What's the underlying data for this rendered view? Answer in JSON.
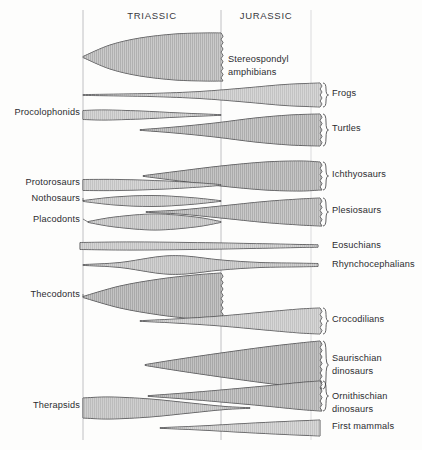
{
  "figure": {
    "background_color": "#fdfdfc",
    "width": 422,
    "height": 450
  },
  "periods": [
    {
      "name": "TRIASSIC",
      "label_x": 152,
      "label_y": 19,
      "start_x": 83,
      "end_x": 221
    },
    {
      "name": "JURASSIC",
      "label_x": 266,
      "label_y": 19,
      "start_x": 221,
      "end_x": 311
    }
  ],
  "axis": {
    "lines": [
      {
        "name": "triassic-start-line",
        "x": 83,
        "y1": 10,
        "y2": 440,
        "faint": false
      },
      {
        "name": "triassic-jurassic-boundary-line",
        "x": 221,
        "y1": 10,
        "y2": 440,
        "faint": false
      },
      {
        "name": "jurassic-end-line",
        "x": 311,
        "y1": 10,
        "y2": 440,
        "faint": true
      }
    ]
  },
  "chart_data": {
    "type": "area",
    "xlabel": "Geologic time",
    "ylabel": "Taxonomic group",
    "x_categories": [
      "TRIASSIC",
      "JURASSIC"
    ],
    "series": [
      {
        "name": "Stereospondyl amphibians",
        "label_side": "inline",
        "label_x": 228,
        "label_y": 62,
        "label_lines": [
          "Stereospondyl",
          "amphibians"
        ],
        "axis_y": 57,
        "x_start": 83,
        "x_end": 221,
        "max_half_width": 24,
        "peak_x": 180,
        "truncated_right": true,
        "shade": "#cfcfcf",
        "points": [
          {
            "x": 83,
            "half": 0.5
          },
          {
            "x": 110,
            "half": 12
          },
          {
            "x": 140,
            "half": 19
          },
          {
            "x": 175,
            "half": 23
          },
          {
            "x": 205,
            "half": 24
          },
          {
            "x": 221,
            "half": 24
          }
        ]
      },
      {
        "name": "Frogs",
        "label_side": "right",
        "label_x": 332,
        "label_y": 96,
        "label_lines": [
          "Frogs"
        ],
        "axis_y": 95,
        "x_start": 83,
        "x_end": 320,
        "max_half_width": 12,
        "peak_x": 320,
        "truncated_right": true,
        "shade": "#d4d4d4",
        "points": [
          {
            "x": 83,
            "half": 0.4
          },
          {
            "x": 150,
            "half": 1.5
          },
          {
            "x": 200,
            "half": 3.5
          },
          {
            "x": 245,
            "half": 7
          },
          {
            "x": 285,
            "half": 10.5
          },
          {
            "x": 320,
            "half": 12
          }
        ]
      },
      {
        "name": "Procolophonids",
        "label_side": "left",
        "label_x": 80,
        "label_y": 115,
        "label_lines": [
          "Procolophonids"
        ],
        "axis_y": 115,
        "x_start": 83,
        "x_end": 221,
        "max_half_width": 5,
        "peak_x": 110,
        "truncated_right": false,
        "shade": "#d4d4d4",
        "points": [
          {
            "x": 83,
            "half": 4.5
          },
          {
            "x": 105,
            "half": 5
          },
          {
            "x": 140,
            "half": 4
          },
          {
            "x": 180,
            "half": 2
          },
          {
            "x": 221,
            "half": 0.3
          }
        ]
      },
      {
        "name": "Turtles",
        "label_side": "right",
        "label_x": 332,
        "label_y": 131,
        "label_lines": [
          "Turtles"
        ],
        "axis_y": 130,
        "x_start": 140,
        "x_end": 320,
        "max_half_width": 16,
        "peak_x": 320,
        "truncated_right": true,
        "shade": "#c9c9c9",
        "points": [
          {
            "x": 140,
            "half": 0.3
          },
          {
            "x": 175,
            "half": 3
          },
          {
            "x": 215,
            "half": 7
          },
          {
            "x": 255,
            "half": 12
          },
          {
            "x": 290,
            "half": 15
          },
          {
            "x": 320,
            "half": 16
          }
        ]
      },
      {
        "name": "Ichthyosaurs",
        "label_side": "right",
        "label_x": 332,
        "label_y": 177,
        "label_lines": [
          "Ichthyosaurs"
        ],
        "axis_y": 176,
        "x_start": 143,
        "x_end": 320,
        "max_half_width": 15,
        "peak_x": 300,
        "truncated_right": true,
        "shade": "#c4c4c4",
        "points": [
          {
            "x": 143,
            "half": 0.3
          },
          {
            "x": 180,
            "half": 5
          },
          {
            "x": 221,
            "half": 10
          },
          {
            "x": 265,
            "half": 14
          },
          {
            "x": 300,
            "half": 15
          },
          {
            "x": 320,
            "half": 14
          }
        ]
      },
      {
        "name": "Protorosaurs",
        "label_side": "left",
        "label_x": 80,
        "label_y": 185,
        "label_lines": [
          "Protorosaurs"
        ],
        "axis_y": 185,
        "x_start": 83,
        "x_end": 221,
        "max_half_width": 5.5,
        "peak_x": 120,
        "truncated_right": false,
        "shade": "#d4d4d4",
        "points": [
          {
            "x": 83,
            "half": 5.5
          },
          {
            "x": 120,
            "half": 5.5
          },
          {
            "x": 165,
            "half": 4
          },
          {
            "x": 200,
            "half": 2
          },
          {
            "x": 221,
            "half": 0.3
          }
        ]
      },
      {
        "name": "Nothosaurs",
        "label_side": "left",
        "label_x": 80,
        "label_y": 201,
        "label_lines": [
          "Nothosaurs"
        ],
        "axis_y": 201,
        "x_start": 83,
        "x_end": 221,
        "max_half_width": 5.5,
        "peak_x": 152,
        "truncated_right": false,
        "shade": "#d0d0d0",
        "points": [
          {
            "x": 83,
            "half": 0.4
          },
          {
            "x": 115,
            "half": 4
          },
          {
            "x": 152,
            "half": 5.5
          },
          {
            "x": 190,
            "half": 3.5
          },
          {
            "x": 221,
            "half": 0.3
          }
        ]
      },
      {
        "name": "Plesiosaurs",
        "label_side": "right",
        "label_x": 332,
        "label_y": 213,
        "label_lines": [
          "Plesiosaurs"
        ],
        "axis_y": 212,
        "x_start": 146,
        "x_end": 320,
        "max_half_width": 14,
        "peak_x": 320,
        "truncated_right": true,
        "shade": "#cdcdcd",
        "points": [
          {
            "x": 146,
            "half": 0.3
          },
          {
            "x": 180,
            "half": 2
          },
          {
            "x": 221,
            "half": 6
          },
          {
            "x": 265,
            "half": 10.5
          },
          {
            "x": 300,
            "half": 13
          },
          {
            "x": 320,
            "half": 14
          }
        ]
      },
      {
        "name": "Placodonts",
        "label_side": "left",
        "label_x": 80,
        "label_y": 222,
        "label_lines": [
          "Placodonts"
        ],
        "axis_y": 222,
        "x_start": 88,
        "x_end": 221,
        "max_half_width": 8,
        "peak_x": 155,
        "truncated_right": false,
        "shade": "#c9c9c9",
        "points": [
          {
            "x": 88,
            "half": 0.4
          },
          {
            "x": 115,
            "half": 5
          },
          {
            "x": 155,
            "half": 8
          },
          {
            "x": 195,
            "half": 5
          },
          {
            "x": 221,
            "half": 0.4
          }
        ]
      },
      {
        "name": "Eosuchians",
        "label_side": "right",
        "label_x": 332,
        "label_y": 248,
        "label_lines": [
          "Eosuchians"
        ],
        "axis_y": 246,
        "x_start": 80,
        "x_end": 318,
        "max_half_width": 4,
        "peak_x": 140,
        "truncated_right": false,
        "shade": "#d2d2d2",
        "points": [
          {
            "x": 80,
            "half": 3.5
          },
          {
            "x": 130,
            "half": 4
          },
          {
            "x": 190,
            "half": 3.5
          },
          {
            "x": 250,
            "half": 2.5
          },
          {
            "x": 295,
            "half": 1.6
          },
          {
            "x": 318,
            "half": 1.2
          }
        ]
      },
      {
        "name": "Rhynchocephalians",
        "label_side": "right",
        "label_x": 332,
        "label_y": 267,
        "label_lines": [
          "Rhynchocephalians"
        ],
        "axis_y": 265,
        "x_start": 83,
        "x_end": 318,
        "max_half_width": 9,
        "peak_x": 170,
        "truncated_right": false,
        "shade": "#c7c7c7",
        "points": [
          {
            "x": 83,
            "half": 0.4
          },
          {
            "x": 120,
            "half": 2.5
          },
          {
            "x": 160,
            "half": 8.5
          },
          {
            "x": 185,
            "half": 9
          },
          {
            "x": 221,
            "half": 5
          },
          {
            "x": 260,
            "half": 2.5
          },
          {
            "x": 300,
            "half": 1.8
          },
          {
            "x": 318,
            "half": 1.5
          }
        ]
      },
      {
        "name": "Thecodonts",
        "label_side": "left",
        "label_x": 80,
        "label_y": 297,
        "label_lines": [
          "Thecodonts"
        ],
        "axis_y": 297,
        "x_start": 83,
        "x_end": 221,
        "max_half_width": 24,
        "peak_x": 221,
        "truncated_right": true,
        "shade": "#bfbfbf",
        "points": [
          {
            "x": 83,
            "half": 0.5
          },
          {
            "x": 120,
            "half": 11
          },
          {
            "x": 160,
            "half": 18
          },
          {
            "x": 195,
            "half": 22
          },
          {
            "x": 221,
            "half": 24
          }
        ]
      },
      {
        "name": "Crocodilians",
        "label_side": "right",
        "label_x": 332,
        "label_y": 322,
        "label_lines": [
          "Crocodilians"
        ],
        "axis_y": 321,
        "x_start": 140,
        "x_end": 320,
        "max_half_width": 13,
        "peak_x": 320,
        "truncated_right": true,
        "shade": "#d4d4d4",
        "points": [
          {
            "x": 140,
            "half": 0.3
          },
          {
            "x": 175,
            "half": 2
          },
          {
            "x": 221,
            "half": 5
          },
          {
            "x": 265,
            "half": 9
          },
          {
            "x": 300,
            "half": 12
          },
          {
            "x": 320,
            "half": 13
          }
        ]
      },
      {
        "name": "Saurischian dinosaurs",
        "label_side": "right",
        "label_x": 332,
        "label_y": 361,
        "label_lines": [
          "Saurischian",
          "dinosaurs"
        ],
        "axis_y": 365,
        "x_start": 145,
        "x_end": 320,
        "max_half_width": 24,
        "peak_x": 320,
        "truncated_right": true,
        "shade": "#bcbcbc",
        "points": [
          {
            "x": 145,
            "half": 0.4
          },
          {
            "x": 180,
            "half": 6
          },
          {
            "x": 221,
            "half": 12
          },
          {
            "x": 265,
            "half": 18
          },
          {
            "x": 300,
            "half": 22
          },
          {
            "x": 320,
            "half": 24
          }
        ]
      },
      {
        "name": "Ornithischian dinosaurs",
        "label_side": "right",
        "label_x": 332,
        "label_y": 399,
        "label_lines": [
          "Ornithischian",
          "dinosaurs"
        ],
        "axis_y": 396,
        "x_start": 148,
        "x_end": 320,
        "max_half_width": 15,
        "peak_x": 320,
        "truncated_right": true,
        "shade": "#c6c6c6",
        "points": [
          {
            "x": 148,
            "half": 0.3
          },
          {
            "x": 185,
            "half": 3
          },
          {
            "x": 221,
            "half": 6
          },
          {
            "x": 265,
            "half": 10
          },
          {
            "x": 300,
            "half": 13.5
          },
          {
            "x": 320,
            "half": 15
          }
        ]
      },
      {
        "name": "Therapsids",
        "label_side": "left",
        "label_x": 80,
        "label_y": 408,
        "label_lines": [
          "Therapsids"
        ],
        "axis_y": 408,
        "x_start": 83,
        "x_end": 250,
        "max_half_width": 11,
        "peak_x": 110,
        "truncated_right": false,
        "shade": "#c4c4c4",
        "points": [
          {
            "x": 83,
            "half": 10
          },
          {
            "x": 110,
            "half": 11
          },
          {
            "x": 150,
            "half": 9
          },
          {
            "x": 190,
            "half": 5
          },
          {
            "x": 225,
            "half": 1.5
          },
          {
            "x": 250,
            "half": 0.3
          }
        ]
      },
      {
        "name": "First mammals",
        "label_side": "right",
        "label_x": 332,
        "label_y": 429,
        "label_lines": [
          "First  mammals"
        ],
        "axis_y": 428,
        "x_start": 160,
        "x_end": 320,
        "max_half_width": 8,
        "peak_x": 320,
        "truncated_right": false,
        "shade": "#d6d6d6",
        "points": [
          {
            "x": 160,
            "half": 0.3
          },
          {
            "x": 200,
            "half": 2
          },
          {
            "x": 245,
            "half": 4.5
          },
          {
            "x": 285,
            "half": 6.5
          },
          {
            "x": 320,
            "half": 8
          }
        ]
      }
    ]
  },
  "style": {
    "outline_color": "#3a3a3c",
    "hatch_color": "#a8a8a8",
    "period_line_color": "#b9b9bd",
    "text_color": "#2c2c30"
  }
}
